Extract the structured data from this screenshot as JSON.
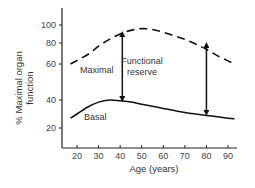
{
  "chart_data": {
    "type": "line",
    "title": "",
    "xlabel": "Age (years)",
    "ylabel_lines": [
      "% Maximal organ",
      "function"
    ],
    "ylabel": "% Maximal organ function",
    "x_ticks": [
      20,
      30,
      40,
      50,
      60,
      70,
      80,
      90
    ],
    "y_ticks": [
      20,
      40,
      60,
      80,
      100
    ],
    "xlim": [
      13,
      95
    ],
    "ylim": [
      10,
      115
    ],
    "grid": false,
    "legend": "none (inline curve labels)",
    "y_scale_note": "non-linear axis spacing",
    "series": [
      {
        "name": "Maximal",
        "style": "dashed",
        "x": [
          17,
          25,
          30,
          35,
          40,
          45,
          50,
          55,
          60,
          65,
          70,
          75,
          80,
          85,
          90,
          93
        ],
        "y": [
          60,
          69,
          77,
          84,
          90,
          94,
          96,
          95,
          92,
          88,
          84,
          79,
          74,
          68,
          63,
          60
        ]
      },
      {
        "name": "Basal",
        "style": "solid",
        "x": [
          17,
          20,
          25,
          30,
          35,
          40,
          45,
          50,
          55,
          60,
          65,
          70,
          75,
          80,
          85,
          90,
          93
        ],
        "y": [
          27,
          30,
          35,
          38.5,
          40,
          39.5,
          38.5,
          37,
          35.5,
          34,
          32.5,
          31,
          30,
          29,
          28,
          27,
          26.5
        ]
      }
    ],
    "annotations": [
      {
        "text": "Maximal",
        "x": 24,
        "y": 57
      },
      {
        "text": "Basal",
        "x": 27,
        "y": 30
      },
      {
        "text": "Functional reserve",
        "lines": [
          "Functional",
          "reserve"
        ],
        "x": 58,
        "y": 68
      },
      {
        "type": "double-arrow",
        "x": 41,
        "y_from": 40,
        "y_to": 91
      },
      {
        "type": "double-arrow",
        "x": 80,
        "y_from": 30,
        "y_to": 79
      }
    ]
  },
  "labels": {
    "maximal": "Maximal",
    "basal": "Basal",
    "reserve_line1": "Functional",
    "reserve_line2": "reserve",
    "xlabel": "Age (years)",
    "ylabel_line1": "% Maximal organ",
    "ylabel_line2": "function"
  },
  "colors": {
    "line": "#111111",
    "axis": "#222222",
    "text": "#333333"
  }
}
